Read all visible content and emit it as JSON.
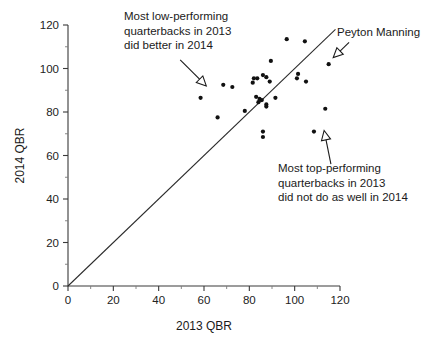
{
  "chart_data": {
    "type": "scatter",
    "title": "",
    "xlabel": "2013 QBR",
    "ylabel": "2014 QBR",
    "xlim": [
      0,
      120
    ],
    "ylim": [
      0,
      120
    ],
    "xticks": [
      0,
      20,
      40,
      60,
      80,
      100,
      120
    ],
    "yticks": [
      0,
      20,
      40,
      60,
      80,
      100,
      120
    ],
    "xtick_labels": [
      "0",
      "20",
      "40",
      "60",
      "80",
      "100",
      "120"
    ],
    "ytick_labels": [
      "0",
      "20",
      "40",
      "60",
      "80",
      "100",
      "120"
    ],
    "minor_ticks": true,
    "grid": false,
    "legend": "none",
    "reference_line": {
      "name": "y = x identity line",
      "from": [
        0,
        0
      ],
      "to": [
        118,
        118
      ]
    },
    "points": [
      {
        "x": 58.5,
        "y": 86.5
      },
      {
        "x": 66.0,
        "y": 77.5
      },
      {
        "x": 68.5,
        "y": 92.5
      },
      {
        "x": 72.5,
        "y": 91.5
      },
      {
        "x": 78.0,
        "y": 80.5
      },
      {
        "x": 81.5,
        "y": 93.5
      },
      {
        "x": 82.0,
        "y": 95.5
      },
      {
        "x": 83.5,
        "y": 95.5
      },
      {
        "x": 83.0,
        "y": 87.0
      },
      {
        "x": 84.0,
        "y": 84.5
      },
      {
        "x": 84.5,
        "y": 86.0
      },
      {
        "x": 85.5,
        "y": 85.5
      },
      {
        "x": 86.0,
        "y": 97.0
      },
      {
        "x": 86.0,
        "y": 71.0
      },
      {
        "x": 86.0,
        "y": 68.5
      },
      {
        "x": 87.5,
        "y": 96.0
      },
      {
        "x": 87.5,
        "y": 83.5
      },
      {
        "x": 87.5,
        "y": 82.5
      },
      {
        "x": 89.0,
        "y": 94.0
      },
      {
        "x": 89.5,
        "y": 103.5
      },
      {
        "x": 91.5,
        "y": 86.5
      },
      {
        "x": 96.5,
        "y": 113.5
      },
      {
        "x": 101.0,
        "y": 95.5
      },
      {
        "x": 101.5,
        "y": 97.5
      },
      {
        "x": 104.5,
        "y": 112.5
      },
      {
        "x": 105.0,
        "y": 94.0
      },
      {
        "x": 108.5,
        "y": 71.0
      },
      {
        "x": 113.5,
        "y": 81.5
      },
      {
        "x": 115.0,
        "y": 102.0
      }
    ],
    "annotations": [
      {
        "id": "low-performers",
        "lines": [
          "Most low-performing",
          "quarterbacks in 2013",
          "did better in 2014"
        ],
        "arrow_from": [
          49.5,
          104.0
        ],
        "arrow_to": [
          61.0,
          92.0
        ]
      },
      {
        "id": "top-performers",
        "lines": [
          "Most top-performing",
          "quarterbacks in 2013",
          "did not do as well in 2014"
        ],
        "arrow_from": [
          116.0,
          56.0
        ],
        "arrow_to": [
          113.0,
          71.5
        ]
      },
      {
        "id": "peyton-manning",
        "lines": [
          "Peyton Manning"
        ],
        "arrow_from": [
          124.0,
          112.0
        ],
        "arrow_to": [
          117.0,
          105.0
        ]
      }
    ]
  }
}
